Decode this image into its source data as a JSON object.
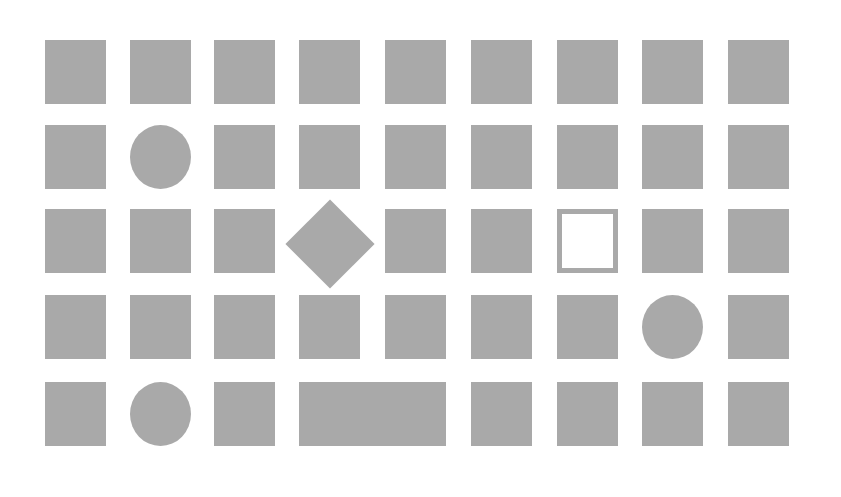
{
  "colors": {
    "fill": "#a9a9a9",
    "background": "#ffffff"
  },
  "grid": {
    "columns": [
      45,
      130,
      214,
      299,
      385,
      471,
      557,
      642,
      728
    ],
    "rows": [
      40,
      125,
      209,
      295,
      382
    ],
    "cell_width": 61,
    "cell_height": 64
  },
  "shapes": [
    {
      "row": 0,
      "col": 0,
      "type": "square"
    },
    {
      "row": 0,
      "col": 1,
      "type": "square"
    },
    {
      "row": 0,
      "col": 2,
      "type": "square"
    },
    {
      "row": 0,
      "col": 3,
      "type": "square"
    },
    {
      "row": 0,
      "col": 4,
      "type": "square"
    },
    {
      "row": 0,
      "col": 5,
      "type": "square"
    },
    {
      "row": 0,
      "col": 6,
      "type": "square"
    },
    {
      "row": 0,
      "col": 7,
      "type": "square"
    },
    {
      "row": 0,
      "col": 8,
      "type": "square"
    },
    {
      "row": 1,
      "col": 0,
      "type": "square"
    },
    {
      "row": 1,
      "col": 1,
      "type": "circle"
    },
    {
      "row": 1,
      "col": 2,
      "type": "square"
    },
    {
      "row": 1,
      "col": 3,
      "type": "square"
    },
    {
      "row": 1,
      "col": 4,
      "type": "square"
    },
    {
      "row": 1,
      "col": 5,
      "type": "square"
    },
    {
      "row": 1,
      "col": 6,
      "type": "square"
    },
    {
      "row": 1,
      "col": 7,
      "type": "square"
    },
    {
      "row": 1,
      "col": 8,
      "type": "square"
    },
    {
      "row": 2,
      "col": 0,
      "type": "square"
    },
    {
      "row": 2,
      "col": 1,
      "type": "square"
    },
    {
      "row": 2,
      "col": 2,
      "type": "square"
    },
    {
      "row": 2,
      "col": 3,
      "type": "diamond"
    },
    {
      "row": 2,
      "col": 4,
      "type": "square"
    },
    {
      "row": 2,
      "col": 5,
      "type": "square"
    },
    {
      "row": 2,
      "col": 6,
      "type": "outline"
    },
    {
      "row": 2,
      "col": 7,
      "type": "square"
    },
    {
      "row": 2,
      "col": 8,
      "type": "square"
    },
    {
      "row": 3,
      "col": 0,
      "type": "square"
    },
    {
      "row": 3,
      "col": 1,
      "type": "square"
    },
    {
      "row": 3,
      "col": 2,
      "type": "square"
    },
    {
      "row": 3,
      "col": 3,
      "type": "square"
    },
    {
      "row": 3,
      "col": 4,
      "type": "square"
    },
    {
      "row": 3,
      "col": 5,
      "type": "square"
    },
    {
      "row": 3,
      "col": 6,
      "type": "square"
    },
    {
      "row": 3,
      "col": 7,
      "type": "circle"
    },
    {
      "row": 3,
      "col": 8,
      "type": "square"
    },
    {
      "row": 4,
      "col": 0,
      "type": "square"
    },
    {
      "row": 4,
      "col": 1,
      "type": "circle"
    },
    {
      "row": 4,
      "col": 2,
      "type": "square"
    },
    {
      "row": 4,
      "col": 3,
      "type": "wide-rect",
      "span": 2
    },
    {
      "row": 4,
      "col": 5,
      "type": "square"
    },
    {
      "row": 4,
      "col": 6,
      "type": "square"
    },
    {
      "row": 4,
      "col": 7,
      "type": "square"
    },
    {
      "row": 4,
      "col": 8,
      "type": "square"
    }
  ]
}
